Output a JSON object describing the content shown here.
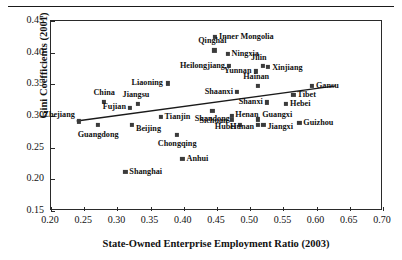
{
  "figure": {
    "top_rule": "",
    "ylabel": "Gini Coefficients (2001)",
    "xlabel": "State-Owned Enterprise Employment Ratio (2003)"
  },
  "chart_data": {
    "type": "scatter",
    "title": "",
    "xlabel": "State-Owned Enterprise Employment Ratio (2003)",
    "ylabel": "Gini Coefficients (2001)",
    "xlim": [
      0.2,
      0.7
    ],
    "ylim": [
      0.15,
      0.45
    ],
    "xticks": [
      "0.20",
      "0.25",
      "0.30",
      "0.35",
      "0.40",
      "0.45",
      "0.50",
      "0.55",
      "0.60",
      "0.65",
      "0.70"
    ],
    "xtick_values": [
      0.2,
      0.25,
      0.3,
      0.35,
      0.4,
      0.45,
      0.5,
      0.55,
      0.6,
      0.65,
      0.7
    ],
    "yticks": [
      "0.15",
      "0.20",
      "0.25",
      "0.30",
      "0.35",
      "0.40",
      "0.45"
    ],
    "ytick_values": [
      0.15,
      0.2,
      0.25,
      0.3,
      0.35,
      0.4,
      0.45
    ],
    "grid": false,
    "legend": "none",
    "marker_color": "#3b3b3b",
    "line_color": "#1a1a1a",
    "trendline": {
      "x0": 0.238,
      "y0": 0.2905,
      "x1": 0.632,
      "y1": 0.3465
    },
    "points": [
      {
        "label": "Zhejiang",
        "x": 0.242,
        "y": 0.2915,
        "lpos": "lft",
        "dx": -4,
        "dy": -6
      },
      {
        "label": "Guangdong",
        "x": 0.271,
        "y": 0.2855,
        "lpos": "ctr",
        "dx": 0,
        "dy": 10
      },
      {
        "label": "China",
        "x": 0.28,
        "y": 0.3225,
        "lpos": "ctr",
        "dx": 0,
        "dy": -9
      },
      {
        "label": "Fujian",
        "x": 0.319,
        "y": 0.3125,
        "lpos": "lft",
        "dx": -4,
        "dy": -1
      },
      {
        "label": "Jiangsu",
        "x": 0.331,
        "y": 0.3185,
        "lpos": "ctr",
        "dx": -2,
        "dy": -9
      },
      {
        "label": "Beijing",
        "x": 0.322,
        "y": 0.2855,
        "lpos": "rgt",
        "dx": 4,
        "dy": 4
      },
      {
        "label": "Liaoning",
        "x": 0.376,
        "y": 0.3515,
        "lpos": "lft",
        "dx": -5,
        "dy": 0
      },
      {
        "label": "Tianjin",
        "x": 0.365,
        "y": 0.2985,
        "lpos": "rgt",
        "dx": 4,
        "dy": 0
      },
      {
        "label": "Chongqing",
        "x": 0.39,
        "y": 0.2705,
        "lpos": "ctr",
        "dx": 0,
        "dy": 9
      },
      {
        "label": "Shanghai",
        "x": 0.312,
        "y": 0.2115,
        "lpos": "rgt",
        "dx": 4,
        "dy": 0
      },
      {
        "label": "Anhui",
        "x": 0.398,
        "y": 0.2325,
        "lpos": "rgt",
        "dx": 4,
        "dy": 0
      },
      {
        "label": "Inner Mongolia",
        "x": 0.447,
        "y": 0.4255,
        "lpos": "rgt",
        "dx": 4,
        "dy": 0
      },
      {
        "label": "Qinghai",
        "x": 0.446,
        "y": 0.4035,
        "lpos": "ctr",
        "dx": -2,
        "dy": -9
      },
      {
        "label": "Ningxia",
        "x": 0.466,
        "y": 0.3985,
        "lpos": "rgt",
        "dx": 4,
        "dy": 0
      },
      {
        "label": "Heilongjiang",
        "x": 0.468,
        "y": 0.3785,
        "lpos": "lft",
        "dx": -4,
        "dy": 0
      },
      {
        "label": "Yunnan",
        "x": 0.508,
        "y": 0.3705,
        "lpos": "lft",
        "dx": -4,
        "dy": 0
      },
      {
        "label": "Jilin",
        "x": 0.519,
        "y": 0.3795,
        "lpos": "ctr",
        "dx": -4,
        "dy": -8
      },
      {
        "label": "Xinjiang",
        "x": 0.527,
        "y": 0.3775,
        "lpos": "rgt",
        "dx": 4,
        "dy": 1
      },
      {
        "label": "Hainan",
        "x": 0.512,
        "y": 0.3475,
        "lpos": "ctr",
        "dx": -2,
        "dy": -9
      },
      {
        "label": "Shaanxi",
        "x": 0.48,
        "y": 0.3385,
        "lpos": "lft",
        "dx": -4,
        "dy": 0
      },
      {
        "label": "Shanxi",
        "x": 0.525,
        "y": 0.3215,
        "lpos": "lft",
        "dx": -4,
        "dy": 0
      },
      {
        "label": "Hebei",
        "x": 0.554,
        "y": 0.3195,
        "lpos": "rgt",
        "dx": 4,
        "dy": 0
      },
      {
        "label": "Gansu",
        "x": 0.593,
        "y": 0.3475,
        "lpos": "rgt",
        "dx": 4,
        "dy": 0
      },
      {
        "label": "Tibet",
        "x": 0.565,
        "y": 0.3335,
        "lpos": "rgt",
        "dx": 4,
        "dy": 0
      },
      {
        "label": "Guizhou",
        "x": 0.574,
        "y": 0.2885,
        "lpos": "rgt",
        "dx": 4,
        "dy": 0
      },
      {
        "label": "Shandong",
        "x": 0.443,
        "y": 0.3075,
        "lpos": "ctr",
        "dx": 0,
        "dy": 8
      },
      {
        "label": "Henan",
        "x": 0.473,
        "y": 0.3005,
        "lpos": "rgt",
        "dx": 3,
        "dy": -1
      },
      {
        "label": "Sichuan",
        "x": 0.472,
        "y": 0.2935,
        "lpos": "lft",
        "dx": -4,
        "dy": 1
      },
      {
        "label": "Hubei",
        "x": 0.485,
        "y": 0.2865,
        "lpos": "lft",
        "dx": -4,
        "dy": 2
      },
      {
        "label": "Hunan",
        "x": 0.512,
        "y": 0.2855,
        "lpos": "lft",
        "dx": -4,
        "dy": 2
      },
      {
        "label": "Jiangxi",
        "x": 0.52,
        "y": 0.2855,
        "lpos": "rgt",
        "dx": 4,
        "dy": 2
      },
      {
        "label": "Guangxi",
        "x": 0.512,
        "y": 0.2945,
        "lpos": "rgt",
        "dx": 4,
        "dy": -4
      }
    ]
  }
}
